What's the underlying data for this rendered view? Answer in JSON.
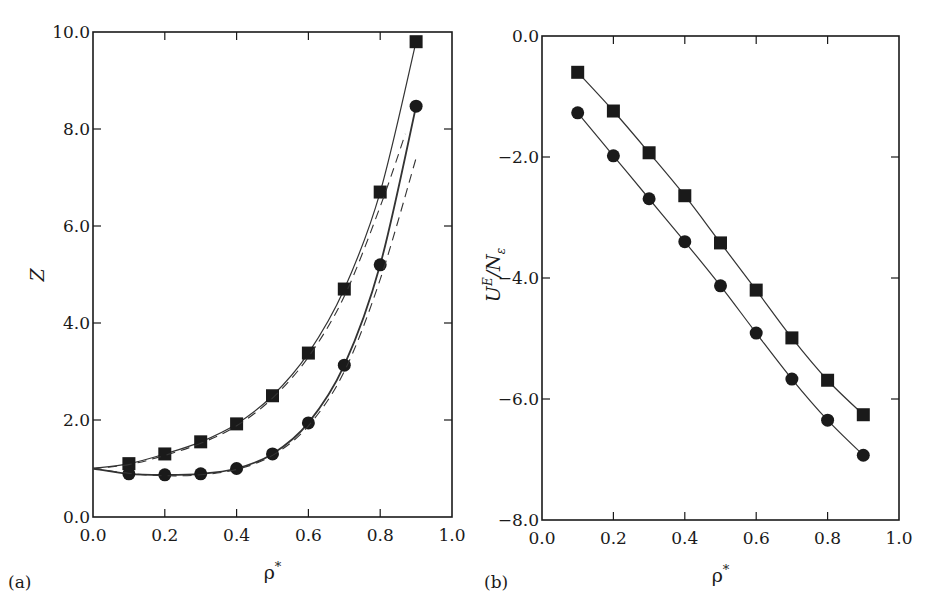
{
  "figure": {
    "panel_a_label": "(a)",
    "panel_b_label": "(b)"
  },
  "colors": {
    "ink": "#1a1a1a",
    "line": "#333333",
    "background": "#ffffff"
  },
  "chart_data": [
    {
      "type": "line",
      "panel": "(a)",
      "title": "",
      "xlabel": "ρ*",
      "ylabel": "Z",
      "xlim": [
        0.0,
        1.0
      ],
      "ylim": [
        0.0,
        10.0
      ],
      "xticks": [
        "0.0",
        "0.2",
        "0.4",
        "0.6",
        "0.8",
        "1.0"
      ],
      "yticks": [
        "0.0",
        "2.0",
        "4.0",
        "6.0",
        "8.0",
        "10.0"
      ],
      "grid": false,
      "legend": null,
      "x": [
        0.1,
        0.2,
        0.3,
        0.4,
        0.5,
        0.6,
        0.7,
        0.8,
        0.9
      ],
      "series": [
        {
          "name": "squares (simulation)",
          "marker": "square",
          "line": "solid",
          "values": [
            1.1,
            1.3,
            1.55,
            1.92,
            2.5,
            3.38,
            4.7,
            6.7,
            9.8
          ]
        },
        {
          "name": "circles (simulation)",
          "marker": "circle",
          "line": "solid",
          "values": [
            0.89,
            0.87,
            0.89,
            1.0,
            1.3,
            1.94,
            3.13,
            5.2,
            8.47
          ]
        },
        {
          "name": "theory (upper, dashed)",
          "marker": "none",
          "line": "dashed",
          "x": [
            0.0,
            0.1,
            0.2,
            0.3,
            0.4,
            0.5,
            0.6,
            0.7,
            0.8,
            0.87
          ],
          "values": [
            1.0,
            1.08,
            1.27,
            1.52,
            1.88,
            2.45,
            3.3,
            4.55,
            6.4,
            7.9
          ]
        },
        {
          "name": "theory (lower, dashed)",
          "marker": "none",
          "line": "dashed",
          "x": [
            0.0,
            0.1,
            0.2,
            0.3,
            0.4,
            0.5,
            0.6,
            0.7,
            0.8,
            0.9
          ],
          "values": [
            1.0,
            0.9,
            0.85,
            0.87,
            0.98,
            1.27,
            1.88,
            3.0,
            4.9,
            7.4
          ]
        }
      ]
    },
    {
      "type": "line",
      "panel": "(b)",
      "title": "",
      "xlabel": "ρ*",
      "ylabel": "U^E/N_ε",
      "xlim": [
        0.0,
        1.0
      ],
      "ylim": [
        -8.0,
        0.0
      ],
      "xticks": [
        "0.0",
        "0.2",
        "0.4",
        "0.6",
        "0.8",
        "1.0"
      ],
      "yticks": [
        "−8.0",
        "−6.0",
        "−4.0",
        "−2.0",
        "0.0"
      ],
      "grid": false,
      "legend": null,
      "x": [
        0.1,
        0.2,
        0.3,
        0.4,
        0.5,
        0.6,
        0.7,
        0.8,
        0.9
      ],
      "series": [
        {
          "name": "squares",
          "marker": "square",
          "line": "solid",
          "values": [
            -0.6,
            -1.24,
            -1.93,
            -2.64,
            -3.42,
            -4.2,
            -4.99,
            -5.69,
            -6.26
          ]
        },
        {
          "name": "circles",
          "marker": "circle",
          "line": "solid",
          "values": [
            -1.27,
            -1.98,
            -2.69,
            -3.4,
            -4.13,
            -4.91,
            -5.67,
            -6.35,
            -6.93
          ]
        }
      ]
    }
  ]
}
